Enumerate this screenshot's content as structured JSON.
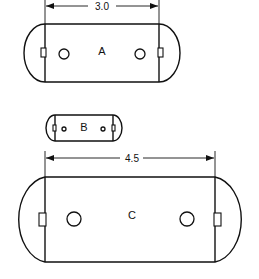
{
  "drawing": {
    "background": "#ffffff",
    "stroke_color": "#111111",
    "parts": [
      {
        "label": "A",
        "dimension": "3.0",
        "rect": {
          "x1": 45,
          "x2": 159,
          "y1": 24,
          "y2": 82
        },
        "holes": [
          {
            "cx": 64,
            "cy": 54,
            "r": 5
          },
          {
            "cx": 140,
            "cy": 54,
            "r": 5
          }
        ],
        "tabs": [
          {
            "x": 41,
            "y": 48,
            "w": 5,
            "h": 9
          },
          {
            "x": 158,
            "y": 48,
            "w": 5,
            "h": 9
          }
        ],
        "label_pos": {
          "x": 102,
          "y": 55
        },
        "dim_line_y": 6
      },
      {
        "label": "B",
        "dimension": "",
        "rect": {
          "x1": 55,
          "x2": 113,
          "y1": 115,
          "y2": 141
        },
        "holes": [
          {
            "cx": 64,
            "cy": 129,
            "r": 2
          },
          {
            "cx": 103,
            "cy": 129,
            "r": 2
          }
        ],
        "tabs": [
          {
            "x": 53,
            "y": 125,
            "w": 3,
            "h": 6
          },
          {
            "x": 112,
            "y": 125,
            "w": 3,
            "h": 6
          }
        ],
        "label_pos": {
          "x": 84,
          "y": 131
        }
      },
      {
        "label": "C",
        "dimension": "4.5",
        "rect": {
          "x1": 45,
          "x2": 215,
          "y1": 177,
          "y2": 262
        },
        "holes": [
          {
            "cx": 74,
            "cy": 219,
            "r": 7
          },
          {
            "cx": 187,
            "cy": 219,
            "r": 7
          }
        ],
        "tabs": [
          {
            "x": 39,
            "y": 213,
            "w": 7,
            "h": 13
          },
          {
            "x": 214,
            "y": 213,
            "w": 7,
            "h": 13
          }
        ],
        "label_pos": {
          "x": 132,
          "y": 219
        },
        "dim_line_y": 158
      }
    ]
  }
}
